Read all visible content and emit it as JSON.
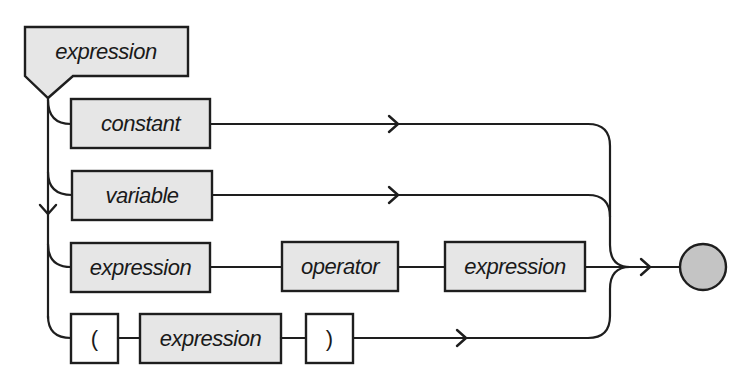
{
  "diagram": {
    "type": "syntax-diagram",
    "title": "expression",
    "alternatives": [
      {
        "name": "constant-branch",
        "items": [
          {
            "kind": "nonterminal",
            "label": "constant"
          }
        ]
      },
      {
        "name": "variable-branch",
        "items": [
          {
            "kind": "nonterminal",
            "label": "variable"
          }
        ]
      },
      {
        "name": "binary-operation-branch",
        "items": [
          {
            "kind": "nonterminal",
            "label": "expression"
          },
          {
            "kind": "nonterminal",
            "label": "operator"
          },
          {
            "kind": "nonterminal",
            "label": "expression"
          }
        ]
      },
      {
        "name": "parenthesized-branch",
        "items": [
          {
            "kind": "terminal",
            "label": "("
          },
          {
            "kind": "nonterminal",
            "label": "expression"
          },
          {
            "kind": "terminal",
            "label": ")"
          }
        ]
      }
    ],
    "end_node": {
      "shape": "circle",
      "fill": "#c4c4c4"
    },
    "colors": {
      "nonterminal_fill": "#e6e6e6",
      "terminal_fill": "#ffffff",
      "stroke": "#1e1e1e"
    }
  }
}
